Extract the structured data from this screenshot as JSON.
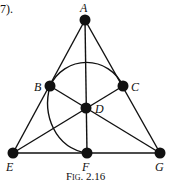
{
  "intro_text": "7).",
  "caption": "Fig. 2.16",
  "points": {
    "A": {
      "label": "A",
      "x": 85,
      "y": 20
    },
    "B": {
      "label": "B",
      "x": 50,
      "y": 86
    },
    "C": {
      "label": "C",
      "x": 123,
      "y": 86
    },
    "D": {
      "label": "D",
      "x": 86,
      "y": 108
    },
    "E": {
      "label": "E",
      "x": 13,
      "y": 153
    },
    "F": {
      "label": "F",
      "x": 87,
      "y": 153
    },
    "G": {
      "label": "G",
      "x": 160,
      "y": 153
    }
  },
  "lines": [
    [
      "A",
      "E"
    ],
    [
      "A",
      "G"
    ],
    [
      "E",
      "G"
    ],
    [
      "A",
      "F"
    ],
    [
      "B",
      "G"
    ],
    [
      "C",
      "E"
    ]
  ],
  "arc": "circle through B, C, F",
  "colors": {
    "stroke": "#111111",
    "fill": "#111111"
  }
}
